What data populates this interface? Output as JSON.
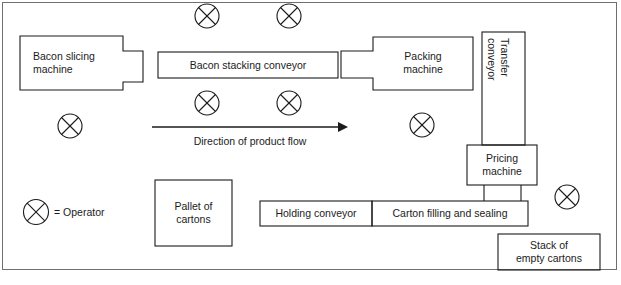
{
  "diagram": {
    "frame_color": "#6f6f6f",
    "line_color": "#1b1b1b",
    "background": "#ffffff",
    "boxes": [
      {
        "id": "bacon-slicing-machine",
        "label": "Bacon slicing\nmachine",
        "line1": "Bacon slicing",
        "line2": "machine"
      },
      {
        "id": "bacon-stacking-conveyor",
        "label": "Bacon stacking conveyor",
        "line1": "Bacon stacking conveyor",
        "line2": ""
      },
      {
        "id": "packing-machine",
        "label": "Packing\nmachine",
        "line1": "Packing",
        "line2": "machine"
      },
      {
        "id": "transfer-conveyor",
        "label": "Transfer\nconveyor",
        "line1": "Transfer",
        "line2": "conveyor"
      },
      {
        "id": "pricing-machine",
        "label": "Pricing\nmachine",
        "line1": "Pricing",
        "line2": "machine"
      },
      {
        "id": "holding-conveyor",
        "label": "Holding conveyor",
        "line1": "Holding conveyor",
        "line2": ""
      },
      {
        "id": "carton-filling-and-sealing",
        "label": "Carton filling and sealing",
        "line1": "Carton filling and sealing",
        "line2": ""
      },
      {
        "id": "pallet-of-cartons",
        "label": "Pallet of\ncartons",
        "line1": "Pallet of",
        "line2": "cartons"
      },
      {
        "id": "stack-of-empty-cartons",
        "label": "Stack of\nempty cartons",
        "line1": "Stack of",
        "line2": "empty cartons"
      }
    ],
    "flow_arrow": {
      "label": "Direction of product flow"
    },
    "legend": {
      "symbol": "operator-symbol",
      "text": "= Operator"
    },
    "operators": {
      "count": 7,
      "positions": [
        {
          "x": 207,
          "y": 16
        },
        {
          "x": 289,
          "y": 16
        },
        {
          "x": 207,
          "y": 103
        },
        {
          "x": 289,
          "y": 103
        },
        {
          "x": 70,
          "y": 126
        },
        {
          "x": 422,
          "y": 125
        },
        {
          "x": 567,
          "y": 197
        }
      ]
    }
  }
}
